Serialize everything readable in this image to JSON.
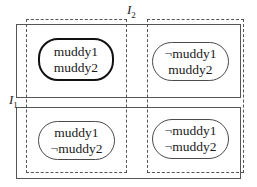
{
  "diagram": {
    "colors": {
      "background": "#ffffff",
      "line": "#555555",
      "node_border": "#4a4a4a",
      "highlight_border": "#111111",
      "text": "#1a1a1a"
    },
    "information_sets": {
      "i1": {
        "label": "I",
        "subscript": "1",
        "style": "solid"
      },
      "i2": {
        "label": "I",
        "subscript": "2",
        "style": "dashed"
      }
    },
    "states": [
      {
        "id": "top-left",
        "line1": "muddy1",
        "line2": "muddy2",
        "highlighted": true
      },
      {
        "id": "top-right",
        "line1": "¬muddy1",
        "line2": "muddy2",
        "highlighted": false
      },
      {
        "id": "bottom-left",
        "line1": "muddy1",
        "line2": "¬muddy2",
        "highlighted": false
      },
      {
        "id": "bottom-right",
        "line1": "¬muddy1",
        "line2": "¬muddy2",
        "highlighted": false
      }
    ]
  }
}
